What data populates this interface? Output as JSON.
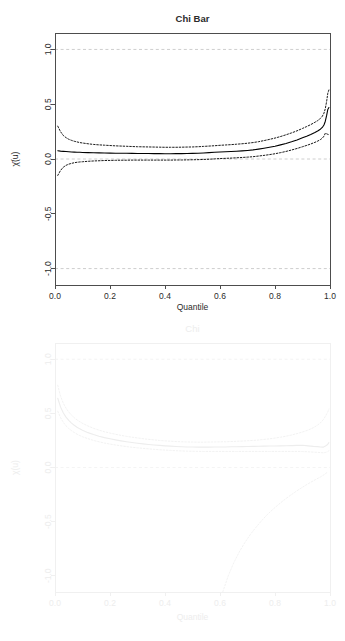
{
  "figure": {
    "background": "#ffffff",
    "panels": [
      "chi_bar",
      "chi"
    ]
  },
  "chart_data": [
    {
      "id": "chi_bar",
      "type": "line",
      "title": "Chi Bar",
      "xlabel": "Quantile",
      "ylabel": "χ̄(u)",
      "xlim": [
        0,
        1
      ],
      "ylim": [
        -1.15,
        1.15
      ],
      "xticks": [
        0.0,
        0.2,
        0.4,
        0.6,
        0.8,
        1.0
      ],
      "xticklabels": [
        "0.0",
        "0.2",
        "0.4",
        "0.6",
        "0.8",
        "1.0"
      ],
      "yticks": [
        -1.0,
        -0.5,
        0.0,
        0.5,
        1.0
      ],
      "yticklabels": [
        "-1.0",
        "-0.5",
        "0.0",
        "0.5",
        "1.0"
      ],
      "grid": false,
      "legend": "none",
      "colors": {
        "estimate": "#000000",
        "confidence": "#000000",
        "reference": "#c8c8c8",
        "frame": "#4d4d4d",
        "text": "#2b2b2b"
      },
      "reference_lines": [
        {
          "y": 1.0,
          "style": "dashed",
          "label": "upper bound 1"
        },
        {
          "y": 0.0,
          "style": "dashed",
          "label": "independence 0"
        },
        {
          "y": -1.0,
          "style": "dashed",
          "label": "lower bound -1"
        }
      ],
      "x": [
        0.01,
        0.02,
        0.03,
        0.04,
        0.05,
        0.06,
        0.07,
        0.08,
        0.09,
        0.1,
        0.12,
        0.14,
        0.16,
        0.18,
        0.2,
        0.22,
        0.24,
        0.26,
        0.28,
        0.3,
        0.32,
        0.34,
        0.36,
        0.38,
        0.4,
        0.42,
        0.44,
        0.46,
        0.48,
        0.5,
        0.52,
        0.54,
        0.56,
        0.58,
        0.6,
        0.62,
        0.64,
        0.66,
        0.68,
        0.7,
        0.72,
        0.74,
        0.76,
        0.78,
        0.8,
        0.82,
        0.84,
        0.86,
        0.88,
        0.9,
        0.915,
        0.93,
        0.945,
        0.955,
        0.965,
        0.972,
        0.978,
        0.983,
        0.988,
        0.992,
        0.996
      ],
      "series": [
        {
          "name": "estimate",
          "style": "solid",
          "values": [
            0.075,
            0.072,
            0.07,
            0.068,
            0.066,
            0.064,
            0.063,
            0.062,
            0.061,
            0.06,
            0.058,
            0.057,
            0.056,
            0.055,
            0.054,
            0.053,
            0.052,
            0.052,
            0.051,
            0.05,
            0.05,
            0.05,
            0.049,
            0.049,
            0.048,
            0.048,
            0.049,
            0.049,
            0.05,
            0.051,
            0.053,
            0.055,
            0.058,
            0.061,
            0.064,
            0.066,
            0.068,
            0.071,
            0.074,
            0.078,
            0.083,
            0.09,
            0.098,
            0.107,
            0.117,
            0.129,
            0.142,
            0.157,
            0.174,
            0.193,
            0.208,
            0.224,
            0.242,
            0.255,
            0.272,
            0.288,
            0.31,
            0.345,
            0.4,
            0.452,
            0.47
          ]
        },
        {
          "name": "upper_ci",
          "style": "dotted",
          "values": [
            0.3,
            0.25,
            0.215,
            0.195,
            0.18,
            0.17,
            0.162,
            0.156,
            0.15,
            0.146,
            0.139,
            0.133,
            0.129,
            0.126,
            0.123,
            0.12,
            0.118,
            0.116,
            0.114,
            0.112,
            0.111,
            0.11,
            0.109,
            0.108,
            0.107,
            0.107,
            0.107,
            0.108,
            0.109,
            0.11,
            0.112,
            0.115,
            0.118,
            0.121,
            0.125,
            0.128,
            0.131,
            0.135,
            0.139,
            0.144,
            0.15,
            0.158,
            0.168,
            0.179,
            0.191,
            0.205,
            0.221,
            0.238,
            0.257,
            0.279,
            0.296,
            0.314,
            0.335,
            0.35,
            0.37,
            0.39,
            0.418,
            0.46,
            0.53,
            0.6,
            0.63
          ]
        },
        {
          "name": "lower_ci",
          "style": "dotted",
          "values": [
            -0.15,
            -0.105,
            -0.075,
            -0.058,
            -0.047,
            -0.04,
            -0.034,
            -0.03,
            -0.027,
            -0.025,
            -0.021,
            -0.018,
            -0.016,
            -0.014,
            -0.013,
            -0.012,
            -0.011,
            -0.011,
            -0.01,
            -0.01,
            -0.01,
            -0.01,
            -0.01,
            -0.01,
            -0.01,
            -0.01,
            -0.009,
            -0.009,
            -0.008,
            -0.007,
            -0.006,
            -0.004,
            -0.002,
            0.001,
            0.004,
            0.006,
            0.008,
            0.011,
            0.014,
            0.017,
            0.021,
            0.027,
            0.033,
            0.04,
            0.048,
            0.058,
            0.069,
            0.082,
            0.096,
            0.112,
            0.124,
            0.137,
            0.152,
            0.163,
            0.177,
            0.19,
            0.208,
            0.235,
            0.23,
            0.225,
            0.222
          ]
        }
      ]
    },
    {
      "id": "chi",
      "type": "line",
      "title": "Chi",
      "xlabel": "Quantile",
      "ylabel": "χ(u)",
      "xlim": [
        0,
        1
      ],
      "ylim": [
        -1.15,
        1.15
      ],
      "xticks": [
        0.0,
        0.2,
        0.4,
        0.6,
        0.8,
        1.0
      ],
      "xticklabels": [
        "0.0",
        "0.2",
        "0.4",
        "0.6",
        "0.8",
        "1.0"
      ],
      "yticks": [
        -1.0,
        -0.5,
        0.0,
        0.5,
        1.0
      ],
      "yticklabels": [
        "-1.0",
        "-0.5",
        "0.0",
        "0.5",
        "1.0"
      ],
      "grid": false,
      "legend": "none",
      "colors": {
        "estimate": "#ededed",
        "confidence": "#f0f0f0",
        "reference": "#f3f3f3",
        "frame": "#f0f0f0",
        "text": "#ededed"
      },
      "reference_lines": [
        {
          "y": 1.0,
          "style": "dashed",
          "label": "upper bound 1"
        },
        {
          "y": 0.0,
          "style": "dashed",
          "label": "independence 0"
        }
      ],
      "x": [
        0.01,
        0.02,
        0.03,
        0.04,
        0.05,
        0.06,
        0.07,
        0.08,
        0.09,
        0.1,
        0.12,
        0.14,
        0.16,
        0.18,
        0.2,
        0.22,
        0.24,
        0.26,
        0.28,
        0.3,
        0.32,
        0.34,
        0.36,
        0.38,
        0.4,
        0.42,
        0.44,
        0.46,
        0.48,
        0.5,
        0.52,
        0.54,
        0.56,
        0.58,
        0.6,
        0.62,
        0.64,
        0.66,
        0.68,
        0.7,
        0.72,
        0.74,
        0.76,
        0.78,
        0.8,
        0.82,
        0.84,
        0.86,
        0.88,
        0.9,
        0.92,
        0.94,
        0.955,
        0.965,
        0.975,
        0.985,
        0.992,
        0.996
      ],
      "series": [
        {
          "name": "estimate",
          "style": "solid",
          "values": [
            0.64,
            0.56,
            0.505,
            0.465,
            0.435,
            0.41,
            0.39,
            0.372,
            0.357,
            0.344,
            0.322,
            0.304,
            0.289,
            0.276,
            0.265,
            0.255,
            0.246,
            0.238,
            0.231,
            0.224,
            0.218,
            0.213,
            0.208,
            0.204,
            0.2,
            0.197,
            0.194,
            0.192,
            0.19,
            0.189,
            0.188,
            0.188,
            0.188,
            0.189,
            0.19,
            0.19,
            0.191,
            0.192,
            0.193,
            0.194,
            0.195,
            0.196,
            0.197,
            0.198,
            0.199,
            0.2,
            0.201,
            0.202,
            0.204,
            0.206,
            0.2,
            0.195,
            0.193,
            0.19,
            0.188,
            0.2,
            0.215,
            0.23
          ]
        },
        {
          "name": "upper_ci",
          "style": "dotted",
          "values": [
            0.76,
            0.66,
            0.595,
            0.548,
            0.512,
            0.484,
            0.46,
            0.44,
            0.423,
            0.408,
            0.383,
            0.362,
            0.345,
            0.33,
            0.318,
            0.307,
            0.297,
            0.288,
            0.28,
            0.273,
            0.266,
            0.26,
            0.255,
            0.25,
            0.246,
            0.243,
            0.24,
            0.238,
            0.236,
            0.235,
            0.234,
            0.234,
            0.235,
            0.236,
            0.237,
            0.238,
            0.24,
            0.242,
            0.244,
            0.247,
            0.25,
            0.254,
            0.259,
            0.265,
            0.272,
            0.28,
            0.289,
            0.3,
            0.313,
            0.328,
            0.345,
            0.368,
            0.392,
            0.412,
            0.44,
            0.48,
            0.515,
            0.54
          ]
        },
        {
          "name": "lower_ci",
          "style": "dotted",
          "values": [
            0.52,
            0.462,
            0.418,
            0.385,
            0.36,
            0.34,
            0.323,
            0.308,
            0.295,
            0.284,
            0.266,
            0.25,
            0.237,
            0.226,
            0.216,
            0.208,
            0.2,
            0.193,
            0.187,
            0.182,
            0.177,
            0.172,
            0.168,
            0.164,
            0.161,
            0.158,
            0.155,
            0.153,
            0.151,
            0.15,
            0.149,
            0.148,
            0.148,
            0.148,
            0.148,
            0.148,
            0.148,
            0.148,
            0.148,
            0.148,
            0.148,
            0.148,
            0.148,
            0.148,
            0.148,
            0.148,
            0.148,
            0.148,
            0.148,
            0.148,
            0.145,
            0.142,
            0.14,
            0.138,
            0.136,
            0.14,
            0.148,
            0.155
          ]
        },
        {
          "name": "lower_bound_curve",
          "style": "dotted",
          "x": [
            0.61,
            0.63,
            0.65,
            0.67,
            0.69,
            0.71,
            0.73,
            0.75,
            0.77,
            0.79,
            0.81,
            0.83,
            0.85,
            0.87,
            0.89,
            0.91,
            0.93,
            0.95,
            0.965,
            0.98,
            0.992
          ],
          "values": [
            -1.15,
            -1.0,
            -0.88,
            -0.78,
            -0.695,
            -0.62,
            -0.555,
            -0.495,
            -0.44,
            -0.392,
            -0.348,
            -0.306,
            -0.268,
            -0.232,
            -0.198,
            -0.166,
            -0.136,
            -0.108,
            -0.088,
            -0.064,
            -0.04
          ]
        }
      ]
    }
  ]
}
